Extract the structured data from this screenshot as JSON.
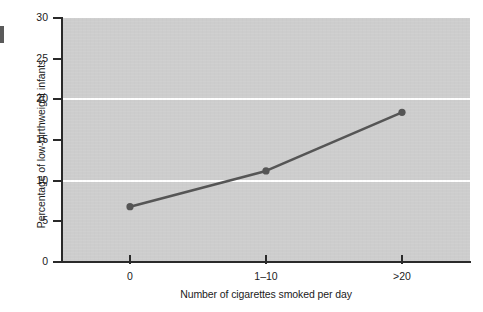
{
  "chart_data": {
    "type": "line",
    "title": "",
    "xlabel": "Number of cigarettes smoked per day",
    "ylabel": "Percentage of low-birthweight infants",
    "categories": [
      "0",
      "1–10",
      ">20"
    ],
    "values": [
      6.8,
      11.2,
      18.4
    ],
    "series": [
      {
        "name": "Percentage of low-birthweight infants",
        "values": [
          6.8,
          11.2,
          18.4
        ]
      }
    ],
    "ylim": [
      0,
      30
    ],
    "yticks": [
      0,
      5,
      10,
      15,
      20,
      25,
      30
    ],
    "ytick_labels": [
      "0",
      "5",
      "10",
      "15",
      "20",
      "25",
      "30"
    ],
    "gridlines": [
      10,
      20
    ],
    "grid": true,
    "legend": "none",
    "plot_background_color": "#cdcdcd",
    "gridline_color": "#ffffff",
    "series_color": "#555555",
    "axis_color": "#2a2a2a",
    "marker": "circle"
  },
  "axes": {
    "y_title": "Percentage of low-birthweight infants",
    "x_title": "Number of cigarettes smoked per day"
  }
}
